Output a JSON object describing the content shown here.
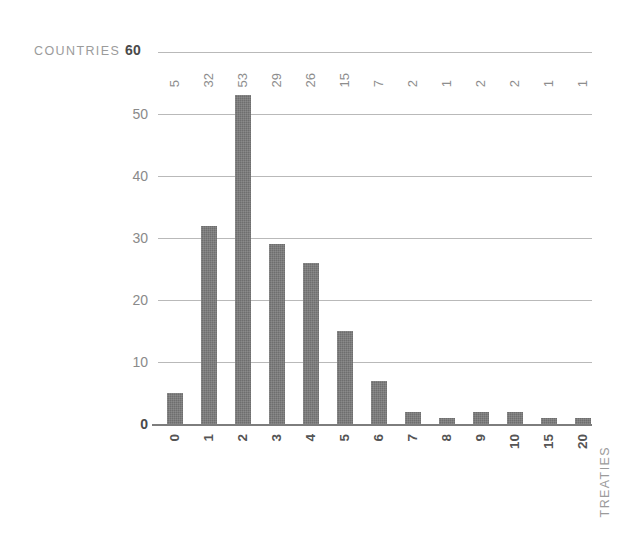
{
  "chart_data": {
    "type": "bar",
    "title": "",
    "subtitle": "",
    "xlabel": "TREATIES",
    "ylabel": "COUNTRIES",
    "categories": [
      "0",
      "1",
      "2",
      "3",
      "4",
      "5",
      "6",
      "7",
      "8",
      "9",
      "10",
      "15",
      "20"
    ],
    "values": [
      5,
      32,
      53,
      29,
      26,
      15,
      7,
      2,
      1,
      2,
      2,
      1,
      1
    ],
    "value_labels": [
      "5",
      "32",
      "53",
      "29",
      "26",
      "15",
      "7",
      "2",
      "1",
      "2",
      "2",
      "1",
      "1"
    ],
    "ylim": [
      0,
      60
    ],
    "yticks": [
      0,
      10,
      20,
      30,
      40,
      50,
      60
    ],
    "ytick_labels": [
      "0",
      "10",
      "20",
      "30",
      "40",
      "50",
      "60"
    ],
    "grid": true,
    "grid_axis": "y",
    "legend": null,
    "legend_position": "none",
    "bar_color": "#6e6e6e",
    "gridline_color": "#b9b9b9",
    "axis_color": "#7d7d7d",
    "label_color": "#8d8d8d",
    "axis_title_color": "#9b9b9b",
    "background_color": "#ffffff",
    "value_label_orientation": "vertical",
    "category_label_orientation": "vertical"
  },
  "axes": {
    "y_title": "COUNTRIES",
    "y_title_value": "60",
    "x_title": "TREATIES"
  }
}
